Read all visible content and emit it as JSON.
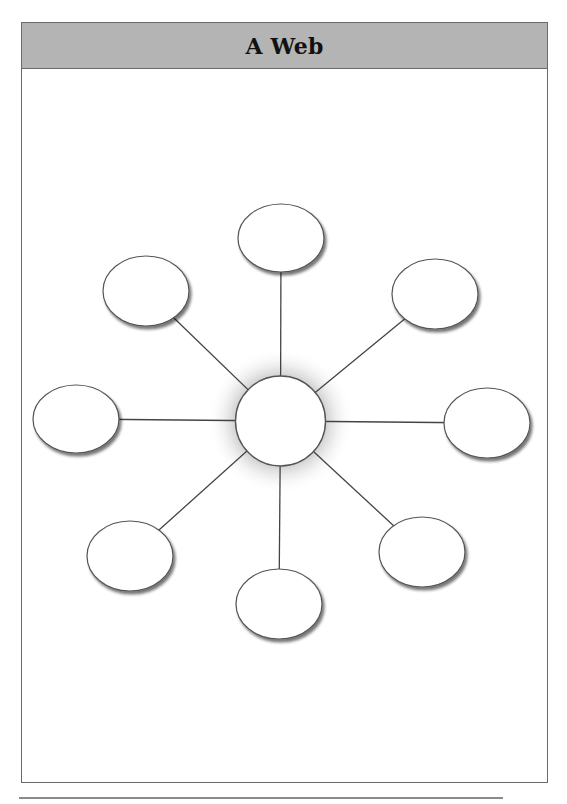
{
  "header": {
    "title": "A Web",
    "background_color": "#b4b4b4"
  },
  "web": {
    "center": {
      "cx": 280.5,
      "cy": 421,
      "r": 45
    },
    "outer_nodes": [
      {
        "id": "top",
        "cx": 281,
        "cy": 238,
        "rx": 43,
        "ry": 34
      },
      {
        "id": "top-left",
        "cx": 146,
        "cy": 291,
        "rx": 43,
        "ry": 35
      },
      {
        "id": "top-right",
        "cx": 435,
        "cy": 294,
        "rx": 43,
        "ry": 35
      },
      {
        "id": "left",
        "cx": 76,
        "cy": 419,
        "rx": 43,
        "ry": 34
      },
      {
        "id": "right",
        "cx": 487,
        "cy": 423,
        "rx": 43,
        "ry": 35
      },
      {
        "id": "bottom-left",
        "cx": 130,
        "cy": 556,
        "rx": 43,
        "ry": 35
      },
      {
        "id": "bottom-right",
        "cx": 422,
        "cy": 552,
        "rx": 43,
        "ry": 35
      },
      {
        "id": "bottom",
        "cx": 279,
        "cy": 604,
        "rx": 43,
        "ry": 35
      }
    ],
    "line_color": "#444444",
    "node_stroke": "#555555",
    "glow_color": "#8a8a8a"
  }
}
